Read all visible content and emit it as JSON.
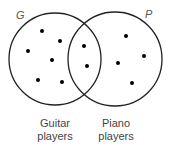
{
  "diagram": {
    "type": "venn",
    "sets": [
      {
        "id": "G",
        "label": "G",
        "caption_line1": "Guitar",
        "caption_line2": "players",
        "cx": 55,
        "cy": 59,
        "r": 46
      },
      {
        "id": "P",
        "label": "P",
        "caption_line1": "Piano",
        "caption_line2": "players",
        "cx": 115,
        "cy": 59,
        "r": 47
      }
    ],
    "points": {
      "only_G": [
        [
          42,
          31
        ],
        [
          60,
          41
        ],
        [
          28,
          51
        ],
        [
          52,
          60
        ],
        [
          38,
          80
        ],
        [
          62,
          82
        ]
      ],
      "both": [
        [
          84,
          46
        ],
        [
          87,
          66
        ]
      ],
      "only_P": [
        [
          126,
          36
        ],
        [
          144,
          56
        ],
        [
          118,
          63
        ],
        [
          132,
          83
        ]
      ]
    },
    "counts": {
      "only_G": 6,
      "both": 2,
      "only_P": 4
    },
    "colors": {
      "stroke": "#222222",
      "dot": "#000000",
      "label": "#555555"
    }
  }
}
